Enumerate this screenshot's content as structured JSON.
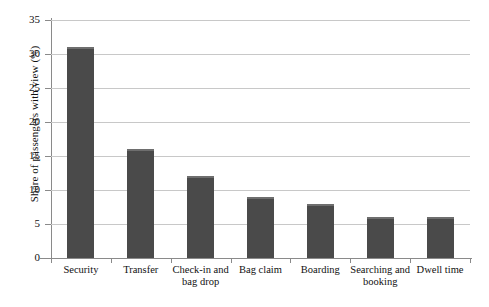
{
  "chart_data": {
    "type": "bar",
    "title": "",
    "xlabel": "",
    "ylabel": "Share of passengers with view (%)",
    "categories": [
      "Security",
      "Transfer",
      "Check-in and bag drop",
      "Bag claim",
      "Boarding",
      "Searching and booking",
      "Dwell time"
    ],
    "values": [
      31,
      16,
      12,
      9,
      8,
      6,
      6
    ],
    "ylim": [
      0,
      35
    ],
    "yticks": [
      0,
      5,
      10,
      15,
      20,
      25,
      30,
      35
    ],
    "ytick_labels": [
      "0",
      "5",
      "10",
      "15",
      "20",
      "25",
      "30",
      "35"
    ],
    "grid": "horizontal",
    "legend": "none",
    "bar_color": "#4a4a4a",
    "bar_top_highlight_color": "#6e6e6e",
    "gridline_color": "#c8c8c8",
    "axis_color": "#8a8a8a",
    "background_color": "#ffffff"
  }
}
